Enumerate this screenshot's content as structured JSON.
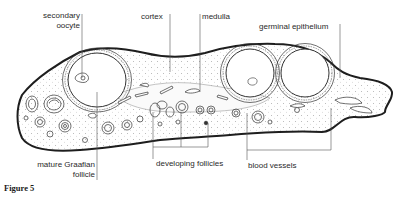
{
  "figure": {
    "caption": "Figure 5",
    "labels": {
      "secondary_oocyte_line1": "secondary",
      "secondary_oocyte_line2": "oocyte",
      "cortex": "cortex",
      "medulla": "medulla",
      "germinal_epithelium": "germinal epithelium",
      "mature_graafian_line1": "mature Graafian",
      "mature_graafian_line2": "follicle",
      "developing_follicles": "developing follicles",
      "blood_vessels": "blood vessels"
    }
  },
  "colors": {
    "ink": "#222222",
    "leader": "#555555",
    "stroma": "#f4f4f4",
    "background": "#ffffff"
  }
}
